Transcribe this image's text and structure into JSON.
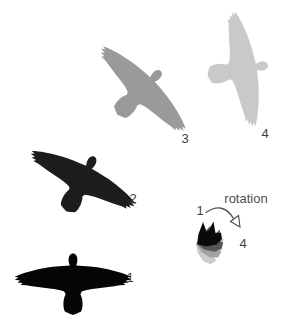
{
  "figure": {
    "background": "#ffffff",
    "label_color": "#3f3f3f",
    "birds": [
      {
        "label": "1",
        "color": "#050505",
        "rotation_deg": 0
      },
      {
        "label": "2",
        "color": "#1d1d1d",
        "rotation_deg": 27
      },
      {
        "label": "3",
        "color": "#9a9a9a",
        "rotation_deg": 45
      },
      {
        "label": "4",
        "color": "#c9c9c9",
        "rotation_deg": 80
      }
    ],
    "inset": {
      "title": "rotation",
      "start_label": "1",
      "end_label": "4",
      "arrow_color": "#4f4f4f",
      "arrowhead_fill": "#ffffff",
      "layers": [
        {
          "color": "#cdcdcd"
        },
        {
          "color": "#a3a3a3"
        },
        {
          "color": "#565656"
        },
        {
          "color": "#0a0a0a"
        }
      ]
    }
  }
}
